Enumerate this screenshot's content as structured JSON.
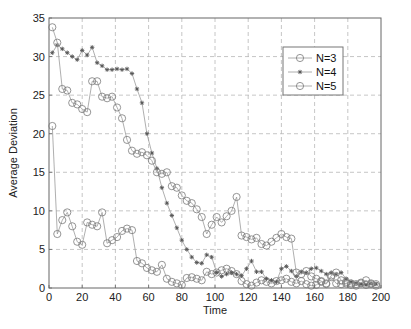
{
  "chart_data": {
    "type": "line",
    "title": "",
    "xlabel": "Time",
    "ylabel": "Average Deviation",
    "xlim": [
      0,
      200
    ],
    "ylim": [
      0,
      35
    ],
    "xticks": [
      0,
      20,
      40,
      60,
      80,
      100,
      120,
      140,
      160,
      180,
      200
    ],
    "yticks": [
      0,
      5,
      10,
      15,
      20,
      25,
      30,
      35
    ],
    "grid": true,
    "legend_position": "upper right",
    "series": [
      {
        "name": "N=3",
        "marker": "circle",
        "x": [
          2,
          5,
          8,
          11,
          14,
          17,
          20,
          23,
          26,
          29,
          32,
          35,
          38,
          41,
          44,
          47,
          50,
          53,
          56,
          59,
          62,
          65,
          68,
          71,
          74,
          77,
          80,
          83,
          86,
          89,
          92,
          95,
          98,
          101,
          104,
          107,
          110,
          113,
          116,
          119,
          122,
          125,
          128,
          131,
          134,
          137,
          140,
          143,
          146,
          149,
          152,
          155,
          158,
          161,
          164,
          167,
          170,
          173,
          176,
          179,
          182,
          185,
          188,
          191,
          194,
          197
        ],
        "y": [
          21,
          7,
          8.8,
          9.8,
          8,
          6,
          5.6,
          8.5,
          8.2,
          8,
          9.8,
          5.8,
          6.2,
          6.6,
          7.4,
          7.7,
          7.5,
          3.5,
          3.2,
          2.6,
          2.3,
          2.1,
          3,
          1.2,
          0.8,
          0.6,
          0.4,
          1.3,
          1.4,
          1.2,
          1,
          2.1,
          1.8,
          2,
          2.3,
          2.5,
          2.2,
          1.8,
          0.9,
          0.5,
          0.3,
          0.7,
          1,
          0.8,
          0.6,
          0.9,
          1,
          1.2,
          0.8,
          0.6,
          0.9,
          0.5,
          0.3,
          0.4,
          0.8,
          0.5,
          1.4,
          0.6,
          0.5,
          0.6,
          0.4,
          0.3,
          0.6,
          0.4,
          0.5,
          0.3
        ]
      },
      {
        "name": "N=4",
        "marker": "star",
        "x": [
          2,
          5,
          8,
          11,
          14,
          17,
          20,
          23,
          26,
          29,
          32,
          35,
          38,
          41,
          44,
          47,
          50,
          53,
          56,
          59,
          62,
          65,
          68,
          71,
          74,
          77,
          80,
          83,
          86,
          89,
          92,
          95,
          98,
          101,
          104,
          107,
          110,
          113,
          116,
          119,
          122,
          125,
          128,
          131,
          134,
          137,
          140,
          143,
          146,
          149,
          152,
          155,
          158,
          161,
          164,
          167,
          170,
          173,
          176,
          179,
          182,
          185,
          188,
          191,
          194,
          197
        ],
        "y": [
          30.5,
          31.5,
          31,
          30.5,
          30,
          29.6,
          30.8,
          30.2,
          31.2,
          29.2,
          28.8,
          28.3,
          28.3,
          28.4,
          28.3,
          28.4,
          27.8,
          25.8,
          24,
          20,
          17.5,
          15.5,
          13,
          11,
          9.4,
          7.8,
          6.2,
          5,
          4,
          3.3,
          3.2,
          4.3,
          4,
          2,
          1.5,
          1.8,
          2,
          1.8,
          1.6,
          2.5,
          3.5,
          2.1,
          2.1,
          1.2,
          1,
          0.8,
          2.5,
          2.8,
          2.2,
          1.5,
          2.1,
          2,
          2.5,
          2.6,
          2.2,
          1.8,
          2,
          1.8,
          2,
          1.2,
          0.8,
          0.6,
          0.5,
          0.4,
          0.6,
          0.5
        ]
      },
      {
        "name": "N=5",
        "marker": "circle",
        "x": [
          2,
          5,
          8,
          11,
          14,
          17,
          20,
          23,
          26,
          29,
          32,
          35,
          38,
          41,
          44,
          47,
          50,
          53,
          56,
          59,
          62,
          65,
          68,
          71,
          74,
          77,
          80,
          83,
          86,
          89,
          92,
          95,
          98,
          101,
          104,
          107,
          110,
          113,
          116,
          119,
          122,
          125,
          128,
          131,
          134,
          137,
          140,
          143,
          146,
          149,
          152,
          155,
          158,
          161,
          164,
          167,
          170,
          173,
          176,
          179,
          182,
          185,
          188,
          191,
          194,
          197
        ],
        "y": [
          33.8,
          31.8,
          25.8,
          25.6,
          24,
          23.8,
          23.2,
          22.8,
          26.8,
          26.8,
          24.8,
          24.6,
          24.8,
          23.4,
          22,
          19.2,
          17.8,
          17.4,
          17.6,
          17.2,
          16.5,
          15,
          14.8,
          15,
          13.2,
          13,
          12,
          11.3,
          11,
          10.2,
          9.2,
          7,
          8.2,
          9.2,
          8.5,
          9.3,
          10,
          11.8,
          6.8,
          6.6,
          6.3,
          6.5,
          5.7,
          5.5,
          6,
          6.5,
          7,
          6.6,
          6.4,
          2,
          1.8,
          2.2,
          1.5,
          1.2,
          0.9,
          0.6,
          1.6,
          2,
          1,
          0.8,
          0.6,
          0.5,
          0.7,
          1,
          0.6,
          0.5
        ]
      }
    ]
  },
  "legend": {
    "items": [
      {
        "label": "N=3",
        "marker": "circle"
      },
      {
        "label": "N=4",
        "marker": "star"
      },
      {
        "label": "N=5",
        "marker": "circle"
      }
    ]
  },
  "axes": {
    "xlabel": "Time",
    "ylabel": "Average Deviation"
  },
  "colors": {
    "line": "#9a9a9a",
    "marker": "#7a7a7a",
    "grid": "#b8b8b8",
    "axis": "#666666"
  }
}
